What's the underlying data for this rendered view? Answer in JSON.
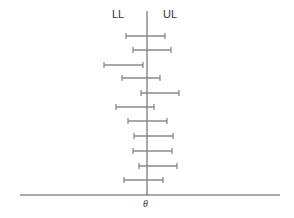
{
  "labels": {
    "lower_limit": "LL",
    "upper_limit": "UL",
    "parameter": "θ"
  },
  "colors": {
    "interval": "#8a8a8a",
    "axis": "#555555",
    "text": "#333333"
  },
  "chart_data": {
    "type": "interval",
    "title": "",
    "true_value_x": 147,
    "baseline": {
      "x1": 20,
      "x2": 280,
      "y": 195
    },
    "center_line": {
      "x": 147,
      "y1": 11,
      "y2": 195
    },
    "intervals": [
      {
        "lower": 126,
        "upper": 165,
        "y": 36
      },
      {
        "lower": 133,
        "upper": 171,
        "y": 50
      },
      {
        "lower": 104,
        "upper": 143,
        "y": 65
      },
      {
        "lower": 122,
        "upper": 160,
        "y": 78
      },
      {
        "lower": 141,
        "upper": 179,
        "y": 93
      },
      {
        "lower": 116,
        "upper": 154,
        "y": 107
      },
      {
        "lower": 128,
        "upper": 167,
        "y": 121
      },
      {
        "lower": 134,
        "upper": 173,
        "y": 136
      },
      {
        "lower": 133,
        "upper": 172,
        "y": 151
      },
      {
        "lower": 139,
        "upper": 177,
        "y": 166
      },
      {
        "lower": 124,
        "upper": 163,
        "y": 180
      }
    ],
    "legend": [
      "LL",
      "UL"
    ],
    "xlabel": "θ"
  }
}
